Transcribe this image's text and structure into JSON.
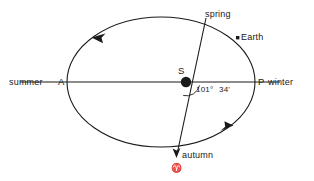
{
  "diagram": {
    "background_color": "#ffffff",
    "stroke_color": "#1a1a1a"
  },
  "labels": {
    "summer": "summer",
    "apogee_point": "A",
    "perigee_point": "P",
    "winter": "winter",
    "spring": "spring",
    "autumn": "autumn",
    "earth": "Earth",
    "sun": "S",
    "angle_degrees": "101°",
    "angle_minutes": "34'",
    "aries_symbol": "♈"
  },
  "geometry": {
    "ellipse": {
      "cx": 161,
      "cy": 82,
      "rx": 94,
      "ry": 65
    },
    "sun": {
      "cx": 186,
      "cy": 82,
      "r": 5
    },
    "earth_marker": {
      "cx": 237.5,
      "cy": 37.5,
      "size": 3
    },
    "apse_line": {
      "x1": 20,
      "y1": 82,
      "x2": 280,
      "y2": 82
    },
    "equinox_line": {
      "x1": 206,
      "y1": 18,
      "x2": 176,
      "y2": 158
    },
    "angle_value_degrees": 101,
    "angle_value_minutes": 34,
    "orbit_direction": "counterclockwise"
  }
}
